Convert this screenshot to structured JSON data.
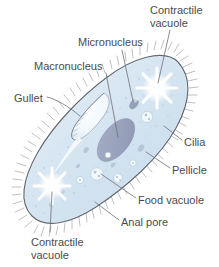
{
  "figure": {
    "background_color": "#ffffff",
    "text_color": "#4b4b4d",
    "body_fill": "#d8e6f0",
    "body_stroke": "#5c6470",
    "nucleus_fill": "#9ba4bd",
    "vacuole_fill": "#ffffff",
    "cilia_color": "#8a9099"
  },
  "labels": {
    "contractile_vacuole_top": {
      "line1": "Contractile",
      "line2": "vacuole"
    },
    "micronucleus": "Micronucleus",
    "macronucleus": "Macronucleus",
    "gullet": "Gullet",
    "cilia": "Cilia",
    "pellicle": "Pellicle",
    "food_vacuole": "Food vacuole",
    "anal_pore": "Anal pore",
    "contractile_vacuole_bottom": {
      "line1": "Contractile",
      "line2": "vacuole"
    }
  },
  "structures": [
    {
      "name": "contractile-vacuole-anterior",
      "kind": "radial-star",
      "cx": 157,
      "cy": 88
    },
    {
      "name": "contractile-vacuole-posterior",
      "kind": "radial-star",
      "cx": 52,
      "cy": 186
    },
    {
      "name": "macronucleus",
      "kind": "oval",
      "cx": 116,
      "cy": 140
    },
    {
      "name": "micronucleus",
      "kind": "small-oval",
      "cx": 134,
      "cy": 105
    },
    {
      "name": "gullet",
      "kind": "crescent-funnel",
      "cx": 87,
      "cy": 122
    },
    {
      "name": "food-vacuole",
      "kind": "granular-circle",
      "cx": 97,
      "cy": 174
    },
    {
      "name": "anal-pore",
      "kind": "edge-opening",
      "cx": 97,
      "cy": 204
    },
    {
      "name": "pellicle",
      "kind": "outer-membrane"
    },
    {
      "name": "cilia",
      "kind": "surface-hairs"
    }
  ]
}
